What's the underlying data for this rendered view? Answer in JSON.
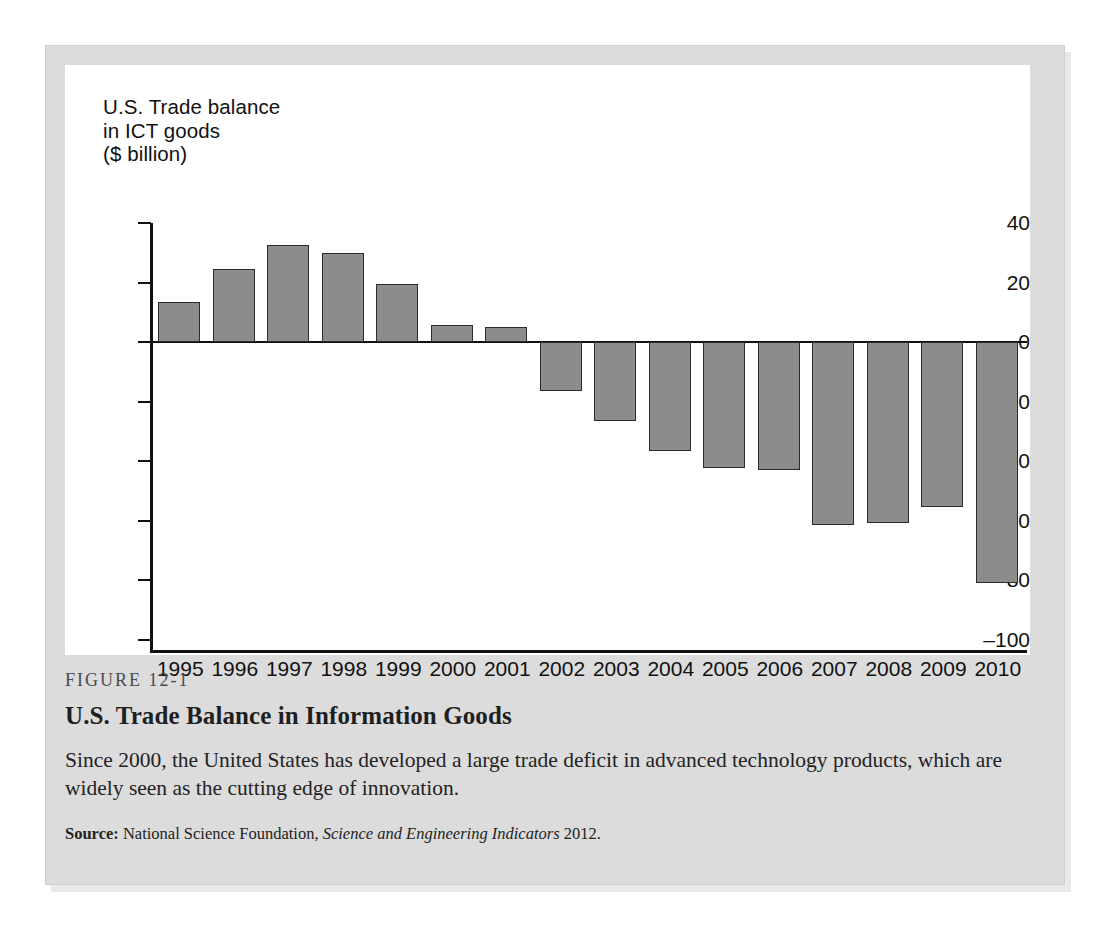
{
  "figure": {
    "number_label": "FIGURE 12-1",
    "heading": "U.S. Trade Balance in Information Goods",
    "description": "Since 2000, the United States has developed a large trade deficit in advanced technology products, which are widely seen as the cutting edge of innovation.",
    "source_label": "Source:",
    "source_org": "National Science Foundation,",
    "source_italic": "Science and Engineering Indicators",
    "source_year": "2012."
  },
  "colors": {
    "bar_fill": "#8c8c8c",
    "bar_stroke": "#2b2b2b",
    "axis": "#111111",
    "panel_background": "#ffffff",
    "figure_background": "#dcdcdc",
    "page_background": "#ffffff"
  },
  "chart_data": {
    "type": "bar",
    "title": "U.S. Trade balance\nin ICT goods\n($ billion)",
    "xlabel": "",
    "ylabel": "U.S. Trade balance in ICT goods ($ billion)",
    "ylim": [
      -100,
      40
    ],
    "yticks": [
      40,
      20,
      0,
      -20,
      -40,
      -60,
      -80,
      -100
    ],
    "ytick_labels": [
      "40",
      "20",
      "0",
      "–20",
      "–40",
      "–60",
      "–80",
      "–100"
    ],
    "grid": false,
    "legend": null,
    "categories": [
      "1995",
      "1996",
      "1997",
      "1998",
      "1999",
      "2000",
      "2001",
      "2002",
      "2003",
      "2004",
      "2005",
      "2006",
      "2007",
      "2008",
      "2009",
      "2010"
    ],
    "values": [
      13.5,
      24.5,
      32.5,
      30,
      19.5,
      5.8,
      5,
      -16.5,
      -26.5,
      -36.5,
      -42.5,
      -43,
      -61.5,
      -61,
      -55.5,
      -81
    ]
  }
}
